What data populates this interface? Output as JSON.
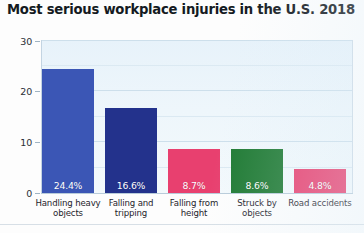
{
  "chart_data": {
    "type": "bar",
    "title": "Most serious workplace injuries in the U.S. 2018",
    "xlabel": "",
    "ylabel": "",
    "ylim": [
      0,
      30
    ],
    "yticks": [
      "0",
      "10",
      "20",
      "30"
    ],
    "grid": true,
    "legend": "none",
    "categories": [
      "Handling heavy objects",
      "Falling and tripping",
      "Falling from height",
      "Struck by objects",
      "Road accidents"
    ],
    "category_lines": [
      [
        "Handling heavy",
        "objects"
      ],
      [
        "Falling and",
        "tripping"
      ],
      [
        "Falling from",
        "height"
      ],
      [
        "Struck by",
        "objects"
      ],
      [
        "Road accidents",
        ""
      ]
    ],
    "values": [
      24.4,
      16.6,
      8.7,
      8.6,
      4.8
    ],
    "data_labels": [
      "24.4%",
      "16.6%",
      "8.7%",
      "8.6%",
      "4.8%"
    ],
    "bar_colors": [
      "#3b56b5",
      "#23328c",
      "#e8406f",
      "#1f7a33",
      "#e8406f"
    ]
  },
  "colors": {
    "plot_background": "#eaf4fb",
    "gridline": "#cddfeb",
    "title_text": "#141a22",
    "axis_text": "#2a2f36",
    "data_label_text": "#ffffff"
  }
}
